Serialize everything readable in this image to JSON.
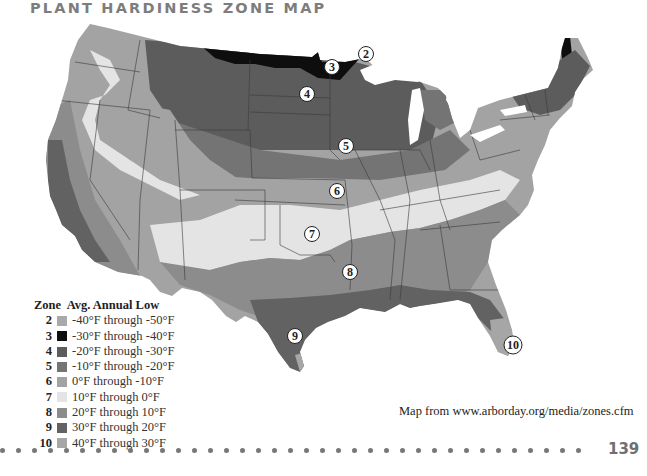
{
  "page": {
    "title": "PLANT HARDINESS ZONE MAP",
    "page_number": "139",
    "credit": "Map from  www.arborday.org/media/zones.cfm"
  },
  "legend": {
    "zone_header": "Zone",
    "low_header": "Avg. Annual Low",
    "items": [
      {
        "zone": "2",
        "range": "-40°F through -50°F",
        "color": "#a9a9a9"
      },
      {
        "zone": "3",
        "range": "-30°F through -40°F",
        "color": "#0e0e0e"
      },
      {
        "zone": "4",
        "range": "-20°F through -30°F",
        "color": "#5c5c5c"
      },
      {
        "zone": "5",
        "range": "-10°F through -20°F",
        "color": "#747474"
      },
      {
        "zone": "6",
        "range": "0°F through -10°F",
        "color": "#a3a3a3"
      },
      {
        "zone": "7",
        "range": "10°F through 0°F",
        "color": "#e4e4e4"
      },
      {
        "zone": "8",
        "range": "20°F through 10°F",
        "color": "#8c8c8c"
      },
      {
        "zone": "9",
        "range": "30°F through 20°F",
        "color": "#626262"
      },
      {
        "zone": "10",
        "range": "40°F through 30°F",
        "color": "#a6a6a6"
      }
    ]
  },
  "map": {
    "zone_markers": [
      {
        "label": "2",
        "zone": 2
      },
      {
        "label": "3",
        "zone": 3
      },
      {
        "label": "4",
        "zone": 4
      },
      {
        "label": "5",
        "zone": 5
      },
      {
        "label": "6",
        "zone": 6
      },
      {
        "label": "7",
        "zone": 7
      },
      {
        "label": "8",
        "zone": 8
      },
      {
        "label": "9",
        "zone": 9
      },
      {
        "label": "10",
        "zone": 10
      }
    ]
  }
}
